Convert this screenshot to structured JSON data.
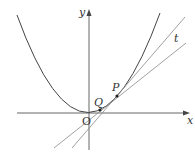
{
  "diagram": {
    "type": "parabola with tangent and secant",
    "colors": {
      "curve": "#444444",
      "axes": "#555555",
      "lines": "#777777",
      "text": "#333333"
    },
    "axes": {
      "x_label": "x",
      "y_label": "y",
      "origin_label": "O"
    },
    "curve": {
      "name": "parabola",
      "description": "y = x^2 shaped curve with vertex at origin"
    },
    "points": [
      {
        "name": "P",
        "label": "P"
      },
      {
        "name": "Q",
        "label": "Q"
      }
    ],
    "lines": [
      {
        "name": "tangent",
        "label": "t",
        "description": "tangent line at P"
      },
      {
        "name": "secant",
        "label": "",
        "description": "secant line through P and Q"
      }
    ]
  }
}
